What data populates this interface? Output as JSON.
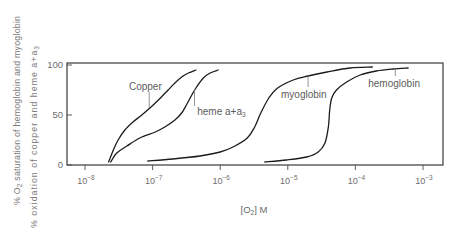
{
  "chart_data": {
    "type": "line",
    "title": "",
    "xlabel": "[O2] M",
    "xlabel_parts": {
      "pre": "[O",
      "sub": "2",
      "post": "] M"
    },
    "ylabel": "% O2 saturation of hemoglobin and myoglobin / % oxidation of copper and heme a+a3",
    "ylabel_lines": [
      {
        "pre": "% O",
        "sub": "2",
        "post": " saturation of hemoglobin and myoglobin"
      },
      {
        "pre": "% oxidation of copper and heme a+a",
        "sub": "3",
        "post": ""
      }
    ],
    "xscale": "log10",
    "xlim_log10": [
      -8.27,
      -2.7
    ],
    "ylim": [
      0,
      100
    ],
    "grid": false,
    "legend": "none (curves labeled directly with leader lines)",
    "x_ticks": [
      {
        "log10": -8,
        "base": "10",
        "exp": "−8"
      },
      {
        "log10": -7,
        "base": "10",
        "exp": "−7"
      },
      {
        "log10": -6,
        "base": "10",
        "exp": "−6"
      },
      {
        "log10": -5,
        "base": "10",
        "exp": "−5"
      },
      {
        "log10": -4,
        "base": "10",
        "exp": "−4"
      },
      {
        "log10": -3,
        "base": "10",
        "exp": "−3"
      }
    ],
    "y_ticks": [
      {
        "value": 0,
        "label": "0"
      },
      {
        "value": 50,
        "label": "50"
      },
      {
        "value": 100,
        "label": "100"
      }
    ],
    "series": [
      {
        "name": "Copper",
        "x_log10": [
          -7.65,
          -7.58,
          -7.51,
          -7.41,
          -7.29,
          -7.16,
          -7.04,
          -6.96,
          -6.87,
          -6.77,
          -6.67,
          -6.57,
          -6.47,
          -6.36
        ],
        "y": [
          3,
          15,
          25,
          35,
          43,
          50,
          57,
          62,
          68,
          75,
          82,
          88,
          92,
          95
        ]
      },
      {
        "name": "heme a+a3",
        "x_log10": [
          -7.62,
          -7.53,
          -7.38,
          -7.19,
          -6.96,
          -6.82,
          -6.67,
          -6.57,
          -6.5,
          -6.42,
          -6.35,
          -6.25,
          -6.15,
          -6.03
        ],
        "y": [
          3,
          12,
          19,
          27,
          33,
          38,
          45,
          52,
          60,
          70,
          78,
          87,
          92,
          95
        ]
      },
      {
        "name": "myoglobin",
        "x_log10": [
          -7.07,
          -6.7,
          -6.3,
          -6.0,
          -5.81,
          -5.6,
          -5.49,
          -5.4,
          -5.28,
          -5.15,
          -4.92,
          -4.7,
          -4.42,
          -4.08,
          -3.75
        ],
        "y": [
          4,
          6,
          9,
          13,
          18,
          27,
          38,
          52,
          67,
          77,
          85,
          89,
          93,
          97,
          98
        ]
      },
      {
        "name": "hemoglobin",
        "x_log10": [
          -5.34,
          -5.02,
          -4.72,
          -4.55,
          -4.45,
          -4.4,
          -4.38,
          -4.35,
          -4.28,
          -4.13,
          -3.93,
          -3.69,
          -3.44,
          -3.22
        ],
        "y": [
          3,
          5,
          8,
          13,
          22,
          38,
          55,
          67,
          75,
          83,
          90,
          94,
          96,
          97
        ]
      }
    ],
    "annotations": [
      {
        "series": "Copper",
        "text": "Copper",
        "sub": "",
        "label_x_log10": -7.35,
        "label_y": 79,
        "leader_x_log10": -7.05,
        "leader_y": [
          73,
          57
        ]
      },
      {
        "series": "heme a+a3",
        "text": "heme a+a",
        "sub": "3",
        "label_x_log10": -6.34,
        "label_y": 54,
        "leader_x_log10": -6.38,
        "leader_y": [
          75,
          59
        ]
      },
      {
        "series": "myoglobin",
        "text": "myoglobin",
        "sub": "",
        "label_x_log10": -5.1,
        "label_y": 71,
        "leader_x_log10": -4.7,
        "leader_y": [
          89,
          78
        ]
      },
      {
        "series": "hemoglobin",
        "text": "hemoglobin",
        "sub": "",
        "label_x_log10": -3.81,
        "label_y": 82,
        "leader_x_log10": -3.41,
        "leader_y": [
          96,
          89
        ]
      }
    ]
  }
}
